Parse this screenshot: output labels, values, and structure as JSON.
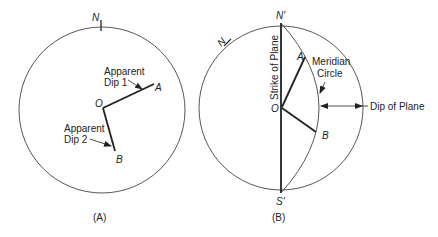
{
  "panel_a": {
    "north_label": "N",
    "point_o": "O",
    "point_a": "A",
    "point_b": "B",
    "apparent_dip_1_line1": "Apparent",
    "apparent_dip_1_line2": "Dip 1",
    "apparent_dip_2_line1": "Apparent",
    "apparent_dip_2_line2": "Dip 2",
    "caption": "(A)"
  },
  "panel_b": {
    "north_label": "N",
    "north_prime_label": "N'",
    "south_prime_label": "S'",
    "point_o": "O",
    "point_a": "A",
    "point_b": "B",
    "strike_label": "Strike of Plane",
    "meridian_line1": "Meridian",
    "meridian_line2": "Circle",
    "dip_label": "Dip of Plane",
    "caption": "(B)"
  },
  "colors": {
    "stroke": "#222222",
    "circle": "#444444",
    "background": "#ffffff"
  }
}
